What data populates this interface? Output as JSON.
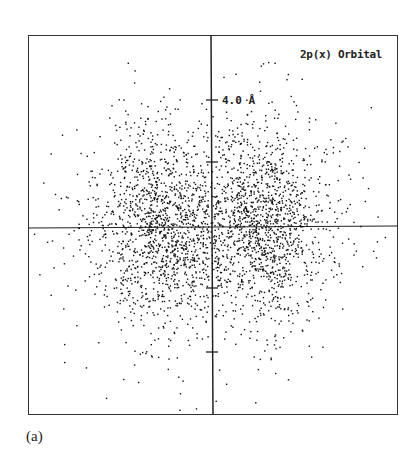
{
  "figure": {
    "title": "2p(x) Orbital",
    "scale_label": "4.0 Å",
    "caption": "(a)"
  },
  "chart_data": {
    "type": "scatter",
    "title": "2p(x) Orbital",
    "xlabel": "",
    "ylabel": "",
    "annotations": [
      "4.0 Å"
    ],
    "axes": {
      "x_axis_through_origin": true,
      "y_axis_through_origin": true
    },
    "y_ticks_px": [
      100,
      162,
      288,
      352
    ],
    "tick_spacing_label": "4.0 Å",
    "lobes": [
      {
        "name": "left lobe",
        "center_px": [
          160,
          225
        ],
        "sigma_px": [
          32,
          48
        ]
      },
      {
        "name": "right lobe",
        "center_px": [
          262,
          225
        ],
        "sigma_px": [
          32,
          48
        ]
      }
    ],
    "dot_count_estimate": 3000,
    "grid": false,
    "legend": null
  }
}
